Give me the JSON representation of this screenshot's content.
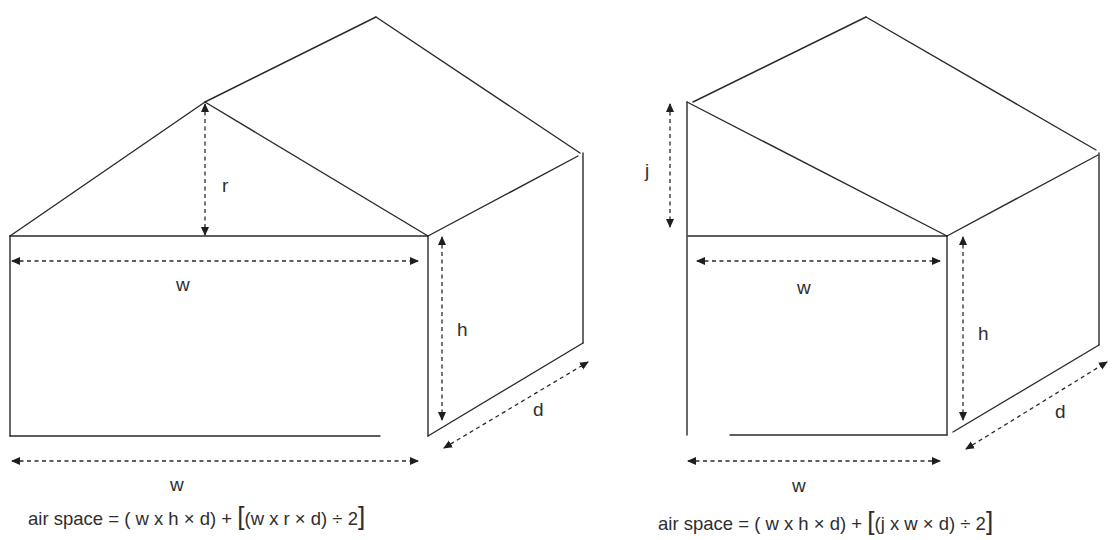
{
  "diagrams": [
    {
      "id": "gable-roof",
      "labels": {
        "ridge_height": "r",
        "width_top": "w",
        "height": "h",
        "depth": "d",
        "width_bottom": "w"
      },
      "formula": {
        "prefix": "air space = ( w x h × d) + ",
        "open_bracket": "[",
        "inner": "(w x r × d) ÷ 2",
        "close_bracket": "]"
      }
    },
    {
      "id": "lean-to-roof",
      "labels": {
        "roof_rise": "j",
        "width_top": "w",
        "height": "h",
        "depth": "d",
        "width_bottom": "w"
      },
      "formula": {
        "prefix": "air space = ( w x h × d) + ",
        "open_bracket": "[",
        "inner": "(j x w × d) ÷ 2",
        "close_bracket": "]"
      }
    }
  ]
}
